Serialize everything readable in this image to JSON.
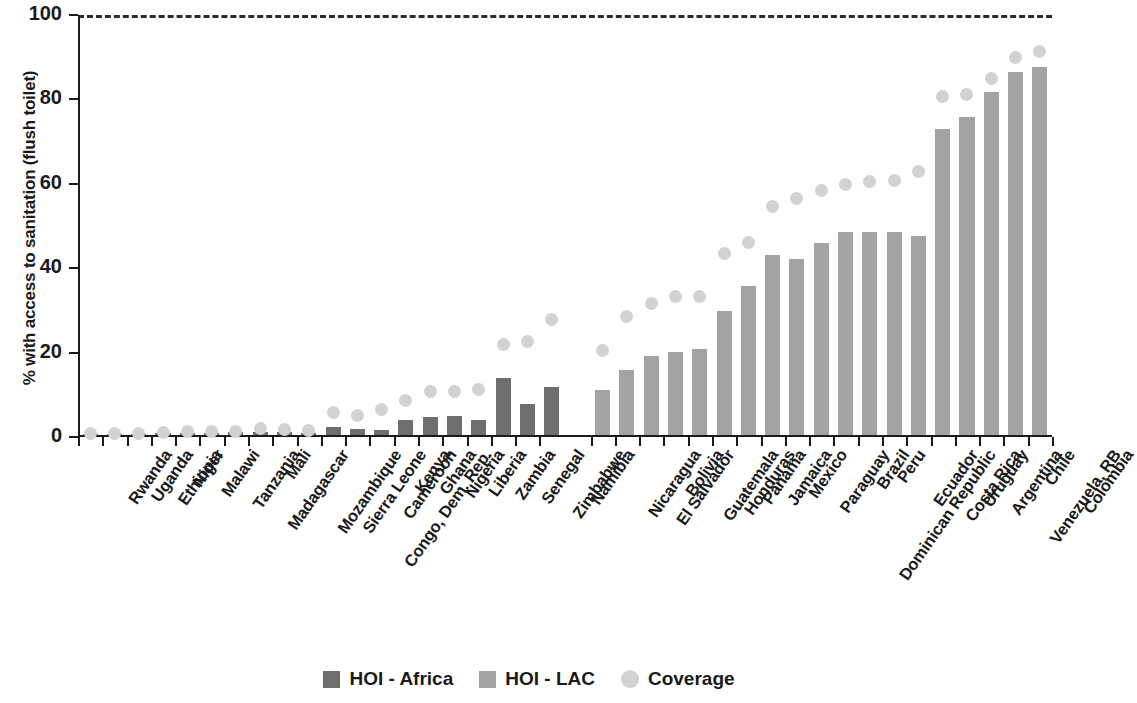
{
  "chart_data": {
    "type": "bar",
    "title": "",
    "subtitle": "",
    "xlabel": "",
    "ylabel": "% with access to sanitation (flush toilet)",
    "ylim": [
      0,
      100
    ],
    "yticks": [
      0,
      20,
      40,
      60,
      80,
      100
    ],
    "grid": false,
    "reference_line": {
      "value": 100,
      "style": "dashed"
    },
    "legend_position": "bottom-center",
    "legend": [
      {
        "name": "HOI - Africa",
        "marker": "square",
        "color": "#6e6e6e"
      },
      {
        "name": "HOI - LAC",
        "marker": "square",
        "color": "#a3a3a3"
      },
      {
        "name": "Coverage",
        "marker": "circle",
        "color": "#d2d2d2"
      }
    ],
    "categories": [
      "Rwanda",
      "Uganda",
      "Ethiopia",
      "Niger",
      "Malawi",
      "Tanzania",
      "Madagascar",
      "Mali",
      "Mozambique",
      "Sierra Leone",
      "Congo, Dem. Rep.",
      "Cameroon",
      "Kenya",
      "Ghana",
      "Nigeria",
      "Liberia",
      "Zambia",
      "Senegal",
      "Zimbabwe",
      "Namibia",
      "Nicaragua",
      "El Salvador",
      "Bolivia",
      "Guatemala",
      "Honduras",
      "Panama",
      "Jamaica",
      "Mexico",
      "Paraguay",
      "Dominican Republic",
      "Brazil",
      "Peru",
      "Ecuador",
      "Costa Rica",
      "Uruguay",
      "Argentina",
      "Venezuela, RB",
      "Chile",
      "Colombia"
    ],
    "groups": [
      {
        "name": "HOI - Africa",
        "start": 0,
        "end": 19
      },
      {
        "name": "HOI - LAC",
        "start": 20,
        "end": 38
      }
    ],
    "series": [
      {
        "name": "HOI - Africa",
        "color": "#6e6e6e",
        "values": [
          0.3,
          0.3,
          0.3,
          0.4,
          0.5,
          0.5,
          0.6,
          0.8,
          0.6,
          0.5,
          1.8,
          1.5,
          1.2,
          3.5,
          4.2,
          4.5,
          3.5,
          13.5,
          7.3,
          11.3,
          null,
          null,
          null,
          null,
          null,
          null,
          null,
          null,
          null,
          null,
          null,
          null,
          null,
          null,
          null,
          null,
          null,
          null,
          null
        ]
      },
      {
        "name": "HOI - LAC",
        "color": "#a3a3a3",
        "values": [
          null,
          null,
          null,
          null,
          null,
          null,
          null,
          null,
          null,
          null,
          null,
          null,
          null,
          null,
          null,
          null,
          null,
          null,
          null,
          null,
          10.7,
          15.4,
          18.8,
          19.7,
          20.5,
          29.5,
          35.4,
          42.6,
          41.6,
          45.4,
          48.0,
          48.0,
          48.0,
          47.2,
          72.4,
          75.4,
          81.3,
          86.0,
          87.2
        ]
      },
      {
        "name": "Coverage",
        "color": "#d2d2d2",
        "marker": "circle",
        "values": [
          0.8,
          0.9,
          0.9,
          1.0,
          1.2,
          1.3,
          1.4,
          1.9,
          1.7,
          1.5,
          5.8,
          5.0,
          6.5,
          8.7,
          10.8,
          10.9,
          11.2,
          22.0,
          22.7,
          27.8,
          20.6,
          28.5,
          31.6,
          33.4,
          33.3,
          43.5,
          46.0,
          54.7,
          56.4,
          58.5,
          59.8,
          60.6,
          60.7,
          62.8,
          80.6,
          81.2,
          85.0,
          90.0,
          91.4
        ]
      }
    ]
  }
}
